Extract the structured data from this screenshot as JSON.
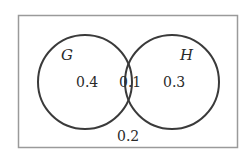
{
  "diagram": {
    "type": "venn",
    "sets": [
      {
        "name": "G",
        "only_value": "0.4"
      },
      {
        "name": "H",
        "only_value": "0.3"
      }
    ],
    "intersection_value": "0.1",
    "outside_value": "0.2"
  },
  "labels": {
    "set_g": "G",
    "set_h": "H",
    "g_only": "0.4",
    "intersection": "0.1",
    "h_only": "0.3",
    "outside": "0.2"
  },
  "colors": {
    "border": "#9a9a9a",
    "circle": "#3a3a3a",
    "text": "#2a2a2a"
  }
}
